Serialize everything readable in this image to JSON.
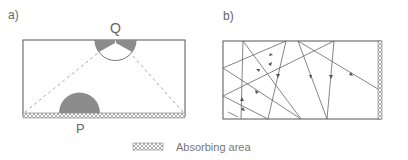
{
  "panels": {
    "a": {
      "label": "a)",
      "point_top": "Q",
      "point_bottom": "P"
    },
    "b": {
      "label": "b)"
    }
  },
  "legend": {
    "text": "Absorbing area"
  },
  "colors": {
    "stroke": "#555555",
    "fill_gray": "#8c8c8c",
    "dashed": "#aaaaaa",
    "hatch": "#999999"
  }
}
